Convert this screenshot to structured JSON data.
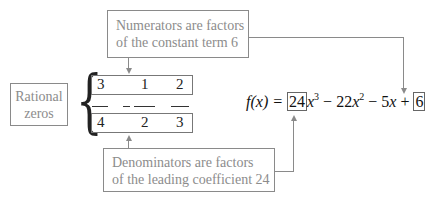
{
  "callouts": {
    "numerators": {
      "line1": "Numerators are factors",
      "line2": "of the constant term 6"
    },
    "denominators": {
      "line1": "Denominators are factors",
      "line2": "of the leading coefficient 24"
    },
    "rational_zeros": {
      "line1": "Rational",
      "line2": "zeros"
    }
  },
  "fractions": {
    "numerators": [
      "3",
      "1",
      "2"
    ],
    "denominators": [
      "4",
      "2",
      "3"
    ],
    "signs": [
      "",
      "−",
      ""
    ]
  },
  "equation": {
    "lhs": "f(x) = ",
    "leading_coefficient": "24",
    "term1_var": "x",
    "term1_exp": "3",
    "op1": " − 22",
    "term2_var": "x",
    "term2_exp": "2",
    "op2": " − 5",
    "term3_var": "x",
    "op3": " + ",
    "constant": "6"
  },
  "colors": {
    "callout_text": "#8c8c8c",
    "lines": "#8a8a8a",
    "math_text": "#111111"
  }
}
